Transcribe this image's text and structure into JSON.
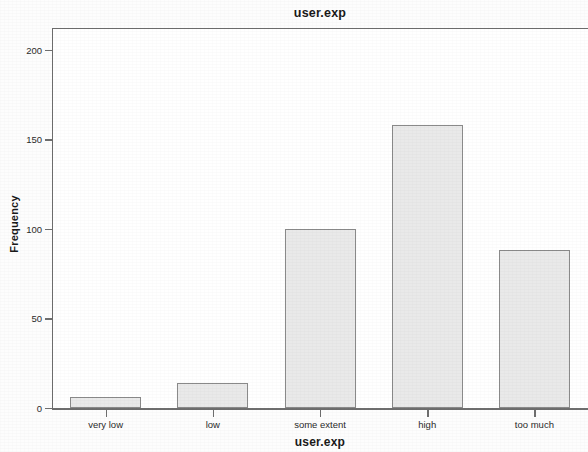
{
  "chart_data": {
    "type": "bar",
    "title": "user.exp",
    "xlabel": "user.exp",
    "ylabel": "Frequency",
    "categories": [
      "very low",
      "low",
      "some extent",
      "high",
      "too much"
    ],
    "values": [
      6,
      14,
      100,
      158,
      88
    ],
    "ylim": [
      0,
      212
    ],
    "yticks": [
      0,
      50,
      100,
      150,
      200
    ],
    "ytick_labels": [
      "0",
      "50",
      "100",
      "150",
      "200"
    ],
    "grid": false,
    "legend": "none",
    "bar_fill_color": "#e9e9e9",
    "bar_border_color": "#8a8a8a",
    "axis_color": "#6e6e6e",
    "text_color": "#1a1a1a"
  }
}
